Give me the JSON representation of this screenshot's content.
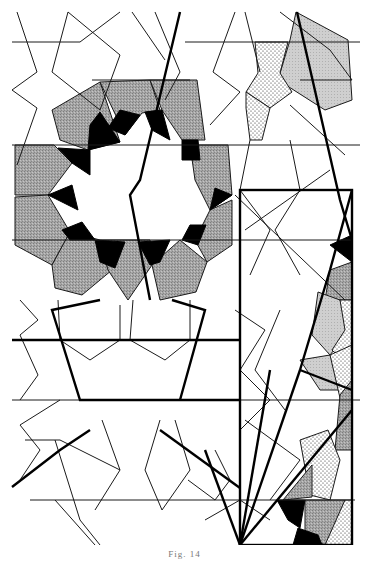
{
  "figure": {
    "caption": "Fig. 14",
    "colors": {
      "line": "#1a1a1a",
      "grey_fill": "#9a9a9a",
      "light_grey_fill": "#c8c8c8",
      "black_fill": "#000000",
      "background": "#ffffff"
    },
    "grey_pentagons": [
      "52,110 100,82 120,142 70,162 40,140",
      "100,82 150,80 165,115 140,140 120,142",
      "150,80 195,82 205,140 165,115",
      "15,145 52,145 70,162 50,195 15,195",
      "195,142 225,145 228,195 205,210 195,180",
      "15,200 50,195 68,232 50,262 15,245",
      "205,210 228,200 232,245 210,260 195,240",
      "50,262 68,232 100,240 110,268 80,290 55,285",
      "100,240 140,240 150,265 130,298 110,268",
      "150,265 175,240 205,260 195,290 160,298",
      "280,10 330,5 350,70 320,95 290,85"
    ],
    "black_triangles": [
      "100,82 120,142 140,112",
      "140,112 165,115 160,140",
      "52,145 70,162 90,155 75,130",
      "205,140 195,142 180,152 190,165",
      "50,195 70,162 85,185",
      "195,180 205,210 185,205",
      "68,232 50,262 85,245",
      "205,210 195,240 180,230",
      "100,240 110,268 125,260 130,245",
      "150,265 175,240 155,245",
      "328,260 352,245 352,275",
      "280,505 300,498 318,520 300,538",
      "295,528 318,520 330,545 295,545"
    ],
    "light_grey_shapes": [
      "280,10 330,5 350,70 320,95 290,85",
      "313,308 340,290 350,330 330,355 310,340",
      "325,395 352,390 352,430 330,435"
    ],
    "dotted_shapes": [
      "255,45 285,45 280,75 290,100 270,100 260,75",
      "335,330 352,330 352,400 325,395 340,360",
      "300,440 340,430 352,450 340,480 310,470",
      "320,480 352,470 352,500 330,510"
    ],
    "frame_rect": {
      "x": 240,
      "y": 190,
      "w": 112,
      "h": 355
    }
  }
}
